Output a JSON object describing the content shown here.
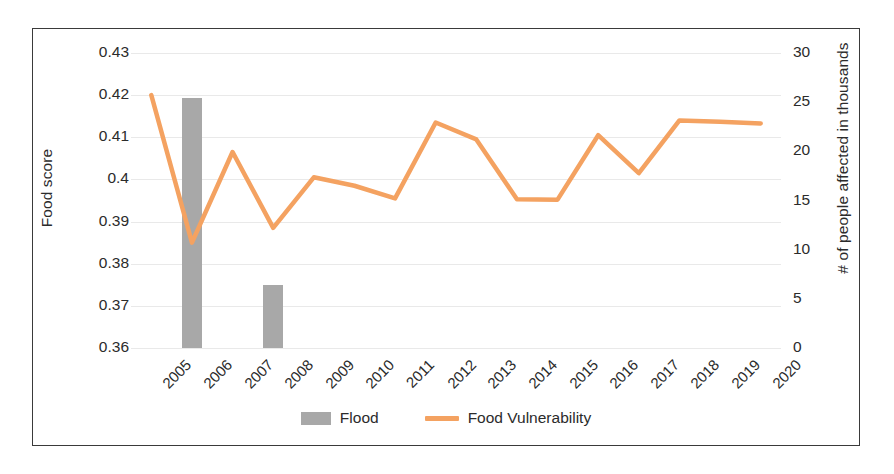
{
  "chart_data": {
    "type": "bar",
    "title": "",
    "subtitle": "",
    "xlabel": "",
    "ylabel": "Food score",
    "y2label": "# of people affected in thousands",
    "categories": [
      "2005",
      "2006",
      "2007",
      "2008",
      "2009",
      "2010",
      "2011",
      "2012",
      "2013",
      "2014",
      "2015",
      "2016",
      "2017",
      "2018",
      "2019",
      "2020"
    ],
    "ylim": [
      0.36,
      0.43
    ],
    "yticks": [
      "0.36",
      "0.37",
      "0.38",
      "0.39",
      "0.4",
      "0.41",
      "0.42",
      "0.43"
    ],
    "y2lim": [
      0,
      30
    ],
    "y2ticks": [
      "0",
      "5",
      "10",
      "15",
      "20",
      "25",
      "30"
    ],
    "grid": true,
    "legend_position": "bottom",
    "series": [
      {
        "name": "Flood",
        "type": "bar",
        "axis": "right",
        "color": "#a8a8a8",
        "values": [
          0,
          25.4,
          0,
          6.4,
          0,
          0,
          0,
          0,
          0,
          0,
          0,
          0,
          0,
          0,
          0,
          0
        ]
      },
      {
        "name": "Food Vulnerability",
        "type": "line",
        "axis": "left",
        "color": "#f4a261",
        "values": [
          0.42,
          0.385,
          0.4065,
          0.3885,
          0.4005,
          0.3985,
          0.3955,
          0.4135,
          0.4095,
          0.3953,
          0.3952,
          0.4105,
          0.4015,
          0.414,
          0.4137,
          0.4133
        ]
      }
    ]
  },
  "legend": {
    "items": [
      {
        "label": "Flood",
        "marker": "bar-swatch",
        "color": "#a8a8a8"
      },
      {
        "label": "Food Vulnerability",
        "marker": "line-swatch",
        "color": "#f4a261"
      }
    ]
  },
  "axes": {
    "left_title": "Food score",
    "right_title": "# of people affected in thousands"
  }
}
